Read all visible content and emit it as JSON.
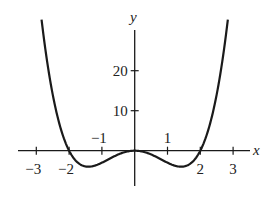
{
  "chart_data": {
    "type": "line",
    "title": "",
    "function": "y = x^4 - 4x^2",
    "xlabel": "x",
    "ylabel": "y",
    "xlim": [
      -3.3,
      3.6
    ],
    "ylim": [
      -10,
      32
    ],
    "x_ticks": [
      -3,
      -2,
      -1,
      1,
      2,
      3
    ],
    "x_tick_labels": [
      "−3",
      "−2",
      "−1",
      "1",
      "2",
      "3"
    ],
    "y_ticks": [
      10,
      20
    ],
    "y_tick_labels": [
      "10",
      "20"
    ],
    "grid": false,
    "legend": null,
    "series": [
      {
        "name": "f(x)",
        "x": [
          -2.83,
          -2.5,
          -2.0,
          -1.5,
          -1.414,
          -1.0,
          -0.5,
          0,
          0.5,
          1.0,
          1.414,
          1.5,
          2.0,
          2.5,
          2.83
        ],
        "y": [
          32.0,
          14.06,
          0,
          -3.94,
          -4.0,
          -3.0,
          -0.94,
          0,
          -0.94,
          -3.0,
          -4.0,
          -3.94,
          0,
          14.06,
          32.0
        ]
      }
    ],
    "annotations": [
      "roots at x = -2, 0, 2",
      "local minima near x = ±1.41, y = -4"
    ]
  },
  "colors": {
    "curve": "#1a1a1a",
    "axis": "#1a1a1a",
    "background": "#ffffff"
  }
}
